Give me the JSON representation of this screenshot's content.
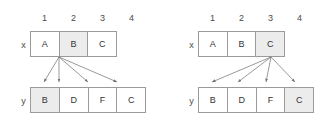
{
  "page": {
    "background_color": "#ffffff",
    "line_color": "#6e6e6e",
    "box_border_color": "#9a9a9a",
    "highlight_color": "#ececec",
    "text_color": "#3a3a3a"
  },
  "diagrams": [
    {
      "id": "left",
      "column_numbers": [
        "1",
        "2",
        "3",
        "4"
      ],
      "x_row": {
        "label": "x",
        "cells": [
          {
            "text": "A",
            "highlighted": false
          },
          {
            "text": "B",
            "highlighted": true
          },
          {
            "text": "C",
            "highlighted": false
          }
        ]
      },
      "y_row": {
        "label": "y",
        "cells": [
          {
            "text": "B",
            "highlighted": true
          },
          {
            "text": "D",
            "highlighted": false
          },
          {
            "text": "F",
            "highlighted": false
          },
          {
            "text": "C",
            "highlighted": false
          }
        ]
      },
      "arrows": {
        "source_cell_index": 1,
        "target_cell_indices": [
          0,
          1,
          2,
          3
        ],
        "count": 4
      }
    },
    {
      "id": "right",
      "column_numbers": [
        "1",
        "2",
        "3",
        "4"
      ],
      "x_row": {
        "label": "x",
        "cells": [
          {
            "text": "A",
            "highlighted": false
          },
          {
            "text": "B",
            "highlighted": false
          },
          {
            "text": "C",
            "highlighted": true
          }
        ]
      },
      "y_row": {
        "label": "y",
        "cells": [
          {
            "text": "B",
            "highlighted": false
          },
          {
            "text": "D",
            "highlighted": false
          },
          {
            "text": "F",
            "highlighted": false
          },
          {
            "text": "C",
            "highlighted": true
          }
        ]
      },
      "arrows": {
        "source_cell_index": 2,
        "target_cell_indices": [
          0,
          1,
          2,
          3
        ],
        "count": 4
      }
    }
  ]
}
